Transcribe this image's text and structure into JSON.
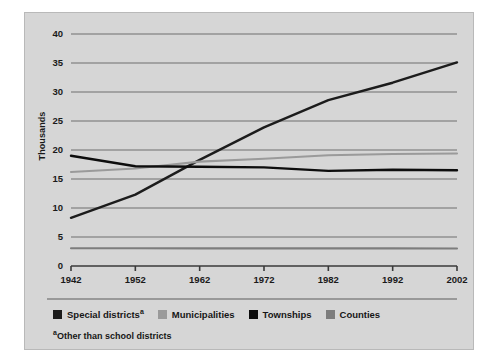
{
  "chart_data": {
    "type": "line",
    "title": "",
    "xlabel": "",
    "ylabel": "Thousands",
    "x": [
      1942,
      1952,
      1962,
      1972,
      1982,
      1992,
      2002
    ],
    "xlim": [
      1942,
      2002
    ],
    "ylim": [
      0,
      40
    ],
    "yticks": [
      0,
      5,
      10,
      15,
      20,
      25,
      30,
      35,
      40
    ],
    "xticks": [
      1942,
      1952,
      1962,
      1972,
      1982,
      1992,
      2002
    ],
    "grid": true,
    "legend_position": "bottom",
    "series": [
      {
        "name": "Special districts",
        "name_sup": "a",
        "color": "#1c1c1c",
        "values": [
          8.3,
          12.3,
          18.3,
          23.9,
          28.6,
          31.6,
          35.1
        ]
      },
      {
        "name": "Municipalities",
        "name_sup": "",
        "color": "#9a9a9a",
        "values": [
          16.2,
          16.8,
          18.0,
          18.5,
          19.1,
          19.3,
          19.4
        ]
      },
      {
        "name": "Townships",
        "name_sup": "",
        "color": "#0d0d0d",
        "values": [
          19.0,
          17.2,
          17.1,
          17.0,
          16.4,
          16.6,
          16.5
        ]
      },
      {
        "name": "Counties",
        "color": "#7d7d7d",
        "name_sup": "",
        "values": [
          3.05,
          3.05,
          3.04,
          3.04,
          3.04,
          3.04,
          3.03
        ]
      }
    ],
    "footnote_marker": "a",
    "footnote": "Other than school districts"
  },
  "axis": {
    "ytick_labels": [
      "40",
      "35",
      "30",
      "25",
      "20",
      "15",
      "10",
      "5",
      "0"
    ],
    "xtick_labels": [
      "1942",
      "1952",
      "1962",
      "1972",
      "1982",
      "1992",
      "2002"
    ],
    "ylabel": "Thousands"
  },
  "legend": {
    "items": [
      {
        "label": "Special districts",
        "sup": "a",
        "color": "#1c1c1c"
      },
      {
        "label": "Municipalities",
        "sup": "",
        "color": "#9a9a9a"
      },
      {
        "label": "Townships",
        "sup": "",
        "color": "#0d0d0d"
      },
      {
        "label": "Counties",
        "sup": "",
        "color": "#7d7d7d"
      }
    ]
  },
  "footnote": {
    "marker": "a",
    "text": "Other than school districts"
  },
  "style": {
    "panel_bg": "#d6d6d6",
    "grid_color": "#6f6f6f",
    "axis_color": "#3a3a3a"
  }
}
